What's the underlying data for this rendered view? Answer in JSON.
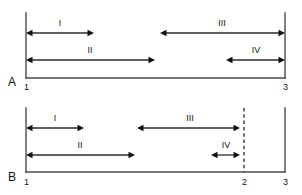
{
  "figure": {
    "type": "interval-diagram",
    "background": "#ffffff",
    "line_color": "#2b2b2b",
    "axis_color": "#4a4a4a",
    "panels": [
      {
        "letter": "A",
        "letter_x": 8,
        "letter_y": 86,
        "axis": {
          "y": 78,
          "x_start": 26,
          "x_end": 285,
          "top": 13
        },
        "boundaries": [
          {
            "name": "left-boundary",
            "x": 26,
            "style": "solid",
            "tick": "1",
            "tick_x": 24,
            "tick_y": 90
          },
          {
            "name": "right-boundary",
            "x": 285,
            "style": "solid",
            "tick": "3",
            "tick_x": 283,
            "tick_y": 90
          }
        ],
        "segments": [
          {
            "id": "I",
            "label": "I",
            "x1": 26,
            "x2": 94,
            "y": 33,
            "left_head": true,
            "right_head": true,
            "label_x": 60,
            "label_y": 26
          },
          {
            "id": "II",
            "label": "II",
            "x1": 26,
            "x2": 155,
            "y": 60,
            "left_head": true,
            "right_head": true,
            "label_x": 90,
            "label_y": 53
          },
          {
            "id": "III",
            "label": "III",
            "x1": 160,
            "x2": 285,
            "y": 33,
            "left_head": true,
            "right_head": true,
            "label_x": 222,
            "label_y": 26
          },
          {
            "id": "IV",
            "label": "IV",
            "x1": 226,
            "x2": 285,
            "y": 60,
            "left_head": true,
            "right_head": true,
            "label_x": 256,
            "label_y": 53
          }
        ]
      },
      {
        "letter": "B",
        "letter_x": 8,
        "letter_y": 181,
        "axis": {
          "y": 172,
          "x_start": 26,
          "x_end": 285,
          "top": 108
        },
        "boundaries": [
          {
            "name": "left-boundary",
            "x": 26,
            "style": "solid",
            "tick": "1",
            "tick_x": 24,
            "tick_y": 185
          },
          {
            "name": "mid-boundary",
            "x": 244,
            "style": "dashed",
            "tick": "2",
            "tick_x": 242,
            "tick_y": 185
          },
          {
            "name": "right-boundary",
            "x": 285,
            "style": "solid",
            "tick": "3",
            "tick_x": 283,
            "tick_y": 185
          }
        ],
        "segments": [
          {
            "id": "I",
            "label": "I",
            "x1": 26,
            "x2": 84,
            "y": 128,
            "left_head": true,
            "right_head": true,
            "label_x": 55,
            "label_y": 121
          },
          {
            "id": "II",
            "label": "II",
            "x1": 26,
            "x2": 135,
            "y": 155,
            "left_head": true,
            "right_head": true,
            "label_x": 80,
            "label_y": 148
          },
          {
            "id": "III",
            "label": "III",
            "x1": 137,
            "x2": 240,
            "y": 128,
            "left_head": true,
            "right_head": true,
            "label_x": 190,
            "label_y": 121
          },
          {
            "id": "IV",
            "label": "IV",
            "x1": 211,
            "x2": 240,
            "y": 155,
            "left_head": true,
            "right_head": true,
            "label_x": 226,
            "label_y": 148
          }
        ]
      }
    ]
  }
}
